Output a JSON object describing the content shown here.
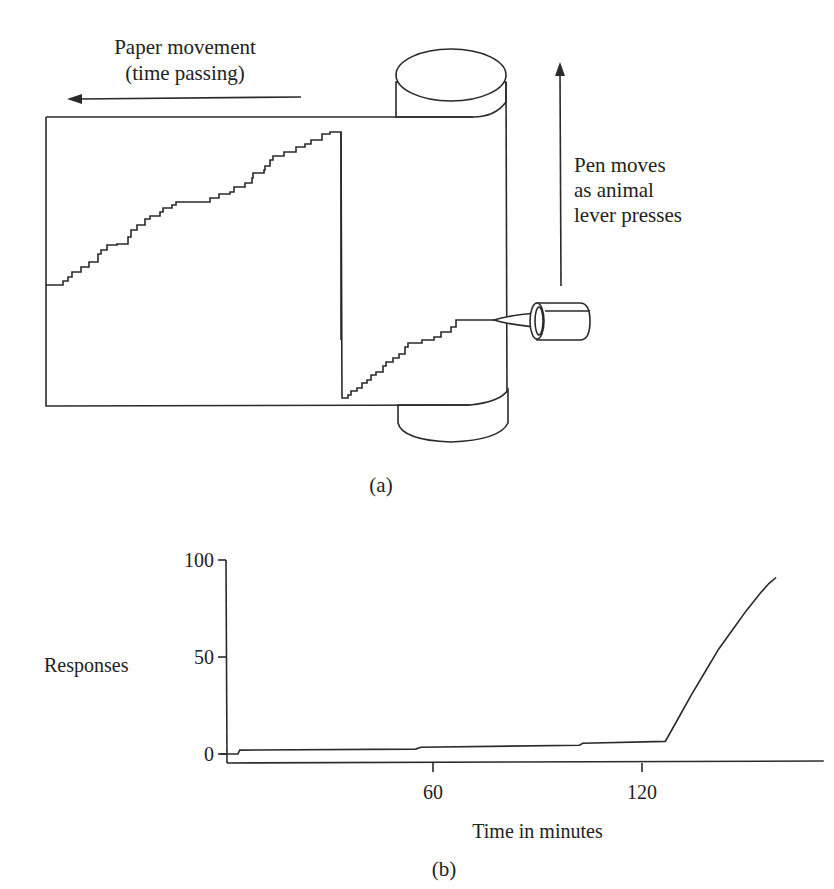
{
  "panel_a": {
    "caption": "(a)",
    "paper_label_line1": "Paper movement",
    "paper_label_line2": "(time passing)",
    "pen_label_line1": "Pen moves",
    "pen_label_line2": "as animal",
    "pen_label_line3": "lever presses",
    "icons": [
      "left-arrow-icon",
      "up-arrow-icon",
      "drum-icon",
      "pen-icon"
    ]
  },
  "panel_b": {
    "caption": "(b)"
  },
  "chart_data": {
    "type": "line",
    "title": "",
    "xlabel": "Time in minutes",
    "ylabel": "Responses",
    "xlim": [
      0,
      165
    ],
    "ylim": [
      0,
      100
    ],
    "x_ticks": [
      60,
      120
    ],
    "x_tick_labels": [
      "60",
      "120"
    ],
    "y_ticks": [
      0,
      50,
      100
    ],
    "y_tick_labels": [
      "0",
      "50",
      "100"
    ],
    "grid": false,
    "legend": "none",
    "series": [
      {
        "name": "cumulative responses",
        "points": [
          [
            -1,
            0
          ],
          [
            4,
            0
          ],
          [
            4.5,
            2
          ],
          [
            55,
            2.5
          ],
          [
            56.5,
            3.5
          ],
          [
            102,
            4.5
          ],
          [
            103,
            5.5
          ],
          [
            126.7,
            6.5
          ],
          [
            130,
            17
          ],
          [
            134,
            30
          ],
          [
            138,
            42
          ],
          [
            142,
            54
          ],
          [
            146,
            64
          ],
          [
            150,
            74
          ],
          [
            154,
            83
          ],
          [
            156.5,
            88
          ],
          [
            158.5,
            91
          ]
        ]
      }
    ]
  }
}
